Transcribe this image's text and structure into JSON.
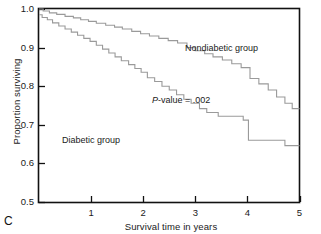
{
  "figure": {
    "panel_letter": "C"
  },
  "chart_data": {
    "type": "line",
    "subtype": "kaplan-meier-step",
    "title": "",
    "xlabel": "Survival time in years",
    "ylabel": "Proportion surviving",
    "xlim": [
      0,
      5
    ],
    "ylim": [
      0.5,
      1.0
    ],
    "xticks": [
      1,
      2,
      3,
      4,
      5
    ],
    "xtick_labels": [
      "1",
      "2",
      "3",
      "4",
      "5"
    ],
    "yticks": [
      0.5,
      0.6,
      0.7,
      0.8,
      0.9,
      1.0
    ],
    "ytick_labels": [
      "0.5",
      "0.6",
      "0.7",
      "0.8",
      "0.9",
      "1.0"
    ],
    "grid": false,
    "legend_position": "inline-annotations",
    "line_color": "#9a9a9a",
    "axis_color": "#111111",
    "annotations": [
      {
        "name": "nondiabetic-label",
        "text": "Nondiabetic group",
        "x": 2.8,
        "y": 0.885
      },
      {
        "name": "diabetic-label",
        "text": "Diabetic group",
        "x": 0.48,
        "y": 0.645
      },
      {
        "name": "p-value-label",
        "text": "P-value = .002",
        "x": 2.18,
        "y": 0.755
      }
    ],
    "series": [
      {
        "name": "Nondiabetic group",
        "color": "#9a9a9a",
        "points": [
          [
            0.0,
            1.0
          ],
          [
            0.08,
            1.0
          ],
          [
            0.08,
            0.995
          ],
          [
            0.2,
            0.995
          ],
          [
            0.2,
            0.99
          ],
          [
            0.34,
            0.99
          ],
          [
            0.34,
            0.986
          ],
          [
            0.5,
            0.986
          ],
          [
            0.5,
            0.981
          ],
          [
            0.66,
            0.981
          ],
          [
            0.66,
            0.977
          ],
          [
            0.8,
            0.977
          ],
          [
            0.8,
            0.972
          ],
          [
            0.95,
            0.972
          ],
          [
            0.95,
            0.968
          ],
          [
            1.1,
            0.968
          ],
          [
            1.1,
            0.963
          ],
          [
            1.28,
            0.963
          ],
          [
            1.28,
            0.958
          ],
          [
            1.45,
            0.958
          ],
          [
            1.45,
            0.953
          ],
          [
            1.6,
            0.953
          ],
          [
            1.6,
            0.948
          ],
          [
            1.78,
            0.948
          ],
          [
            1.78,
            0.942
          ],
          [
            1.95,
            0.942
          ],
          [
            1.95,
            0.936
          ],
          [
            2.12,
            0.936
          ],
          [
            2.12,
            0.93
          ],
          [
            2.3,
            0.93
          ],
          [
            2.3,
            0.924
          ],
          [
            2.48,
            0.924
          ],
          [
            2.48,
            0.918
          ],
          [
            2.66,
            0.918
          ],
          [
            2.66,
            0.912
          ],
          [
            2.84,
            0.912
          ],
          [
            2.84,
            0.9
          ],
          [
            3.0,
            0.9
          ],
          [
            3.0,
            0.892
          ],
          [
            3.18,
            0.892
          ],
          [
            3.18,
            0.884
          ],
          [
            3.34,
            0.884
          ],
          [
            3.34,
            0.876
          ],
          [
            3.52,
            0.876
          ],
          [
            3.52,
            0.868
          ],
          [
            3.7,
            0.868
          ],
          [
            3.7,
            0.858
          ],
          [
            3.88,
            0.858
          ],
          [
            3.88,
            0.848
          ],
          [
            4.05,
            0.848
          ],
          [
            4.05,
            0.82
          ],
          [
            4.22,
            0.82
          ],
          [
            4.22,
            0.806
          ],
          [
            4.4,
            0.806
          ],
          [
            4.4,
            0.79
          ],
          [
            4.56,
            0.79
          ],
          [
            4.56,
            0.772
          ],
          [
            4.72,
            0.772
          ],
          [
            4.72,
            0.756
          ],
          [
            4.86,
            0.756
          ],
          [
            4.86,
            0.742
          ],
          [
            5.0,
            0.742
          ]
        ]
      },
      {
        "name": "Diabetic group",
        "color": "#9a9a9a",
        "points": [
          [
            0.0,
            0.985
          ],
          [
            0.06,
            0.985
          ],
          [
            0.06,
            0.978
          ],
          [
            0.16,
            0.978
          ],
          [
            0.16,
            0.972
          ],
          [
            0.26,
            0.972
          ],
          [
            0.26,
            0.964
          ],
          [
            0.38,
            0.964
          ],
          [
            0.38,
            0.956
          ],
          [
            0.5,
            0.956
          ],
          [
            0.5,
            0.948
          ],
          [
            0.62,
            0.948
          ],
          [
            0.62,
            0.94
          ],
          [
            0.74,
            0.94
          ],
          [
            0.74,
            0.932
          ],
          [
            0.86,
            0.932
          ],
          [
            0.86,
            0.924
          ],
          [
            0.98,
            0.924
          ],
          [
            0.98,
            0.916
          ],
          [
            1.1,
            0.916
          ],
          [
            1.1,
            0.906
          ],
          [
            1.22,
            0.906
          ],
          [
            1.22,
            0.896
          ],
          [
            1.34,
            0.896
          ],
          [
            1.34,
            0.886
          ],
          [
            1.46,
            0.886
          ],
          [
            1.46,
            0.876
          ],
          [
            1.58,
            0.876
          ],
          [
            1.58,
            0.866
          ],
          [
            1.72,
            0.866
          ],
          [
            1.72,
            0.856
          ],
          [
            1.84,
            0.856
          ],
          [
            1.84,
            0.846
          ],
          [
            1.96,
            0.846
          ],
          [
            1.96,
            0.836
          ],
          [
            2.08,
            0.836
          ],
          [
            2.08,
            0.822
          ],
          [
            2.22,
            0.822
          ],
          [
            2.22,
            0.812
          ],
          [
            2.36,
            0.812
          ],
          [
            2.36,
            0.8
          ],
          [
            2.5,
            0.8
          ],
          [
            2.5,
            0.79
          ],
          [
            2.64,
            0.79
          ],
          [
            2.64,
            0.778
          ],
          [
            2.78,
            0.778
          ],
          [
            2.78,
            0.766
          ],
          [
            2.92,
            0.766
          ],
          [
            2.92,
            0.756
          ],
          [
            3.08,
            0.756
          ],
          [
            3.08,
            0.742
          ],
          [
            3.22,
            0.742
          ],
          [
            3.22,
            0.732
          ],
          [
            3.44,
            0.732
          ],
          [
            3.44,
            0.722
          ],
          [
            3.92,
            0.722
          ],
          [
            3.92,
            0.712
          ],
          [
            4.02,
            0.712
          ],
          [
            4.02,
            0.66
          ],
          [
            4.72,
            0.66
          ],
          [
            4.72,
            0.646
          ],
          [
            5.0,
            0.646
          ]
        ]
      }
    ]
  }
}
